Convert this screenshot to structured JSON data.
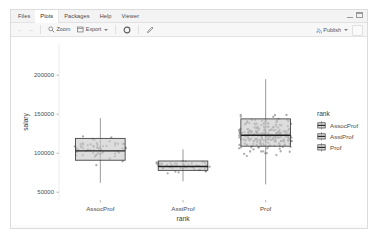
{
  "window": {
    "tabs": [
      {
        "label": "Files",
        "active": false,
        "name": "tab-files"
      },
      {
        "label": "Plots",
        "active": true,
        "name": "tab-plots"
      },
      {
        "label": "Packages",
        "active": false,
        "name": "tab-packages"
      },
      {
        "label": "Help",
        "active": false,
        "name": "tab-help"
      },
      {
        "label": "Viewer",
        "active": false,
        "name": "tab-viewer"
      }
    ],
    "controls": {
      "minimize": "minimize-icon",
      "maximize": "maximize-icon"
    }
  },
  "toolbar": {
    "back_label": "←",
    "forward_label": "→",
    "zoom_label": "Zoom",
    "zoom_icon": "magnifier-icon",
    "export_label": "Export",
    "export_icon": "export-icon",
    "remove_icon": "remove-plot-icon",
    "clear_icon": "clear-all-plots-icon",
    "publish_label": "Publish",
    "publish_icon": "publish-icon"
  },
  "chart_data": {
    "type": "boxplot",
    "title": "",
    "xlabel": "rank",
    "ylabel": "salary",
    "categories": [
      "AssocProf",
      "AsstProf",
      "Prof"
    ],
    "ylim": [
      40000,
      240000
    ],
    "yticks": [
      50000,
      100000,
      150000,
      200000
    ],
    "ytick_labels": [
      "50000",
      "100000",
      "150000",
      "200000"
    ],
    "grid": false,
    "jitter_points": true,
    "legend": {
      "title": "rank",
      "position": "right",
      "entries": [
        "AssocProf",
        "AsstProf",
        "Prof"
      ],
      "key_glyph": "boxplot-icon"
    },
    "boxes": [
      {
        "category": "AssocProf",
        "min": 62000,
        "q1": 91000,
        "median": 103000,
        "q3": 119000,
        "max": 145000,
        "fill": "#c8c8c8",
        "outline": "#3c3c3c"
      },
      {
        "category": "AsstProf",
        "min": 64000,
        "q1": 78000,
        "median": 83000,
        "q3": 90000,
        "max": 105000,
        "fill": "#c8c8c8",
        "outline": "#3c3c3c"
      },
      {
        "category": "Prof",
        "min": 60000,
        "q1": 109000,
        "median": 123000,
        "q3": 144000,
        "max": 195000,
        "fill": "#c8c8c8",
        "outline": "#3c3c3c"
      }
    ],
    "point_color": "#8c8c8c",
    "panel_background": "#ffffff",
    "axis_text_color": "#4d4d4d"
  }
}
